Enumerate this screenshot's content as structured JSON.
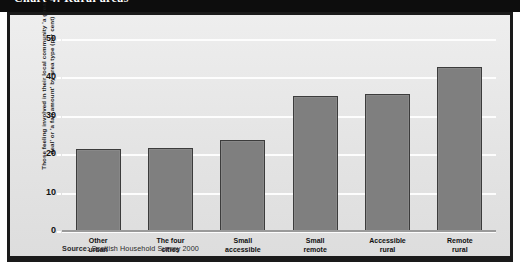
{
  "title": "Chart 4: Rural areas",
  "source_prefix": "Source:",
  "source_text": "Scottish Household Survey 2000",
  "colors": {
    "bar_fill": "#7f7f7f",
    "bar_outline": "#3c3c3c",
    "panel_background": "#e8e8e8",
    "frame": "#1a1a1a",
    "gridline": "#fdfdfd",
    "title_band": "#0d0d0d"
  },
  "chart_data": {
    "type": "bar",
    "title": "Chart 4: Rural areas",
    "xlabel": "",
    "ylabel": "Those feeling involved in their local community 'a great deal' or 'a fair amount' by area type (per cent)",
    "ylim": [
      0,
      50
    ],
    "ytick_labels": [
      "0",
      "10",
      "20",
      "30",
      "40",
      "50"
    ],
    "yticks": [
      0,
      10,
      20,
      30,
      40,
      50
    ],
    "grid": true,
    "legend": "none",
    "categories": [
      "Other\nurban",
      "The four\ncities",
      "Small\naccessible",
      "Small\nremote",
      "Accessible\nrural",
      "Remote\nrural"
    ],
    "values": [
      21.5,
      22,
      24,
      35.5,
      36,
      43
    ]
  }
}
